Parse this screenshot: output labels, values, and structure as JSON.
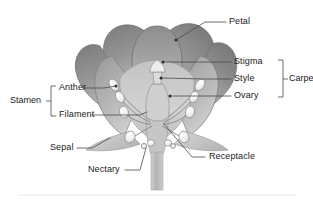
{
  "figure": {
    "kind": "botanical-diagram",
    "background_color": "#ffffff",
    "line_color": "#4a4a4a",
    "text_color": "#1a1a1a"
  },
  "labels": {
    "petal": "Petal",
    "stigma": "Stigma",
    "style": "Style",
    "ovary": "Ovary",
    "carpel": "Carpel",
    "anther": "Anther",
    "filament": "Filament",
    "stamen": "Stamen",
    "sepal": "Sepal",
    "nectary": "Nectary",
    "receptacle": "Receptacle"
  },
  "groups": {
    "carpel_members": [
      "Stigma",
      "Style",
      "Ovary"
    ],
    "stamen_members": [
      "Anther",
      "Filament"
    ]
  },
  "colors": {
    "petal_outer": "#8a8a8a",
    "petal_inner": "#b9b9b9",
    "sepal": "#cccccc",
    "stem": "#bdbdbd",
    "highlight": "#f2f2f2",
    "outline": "#6d6d6d"
  }
}
